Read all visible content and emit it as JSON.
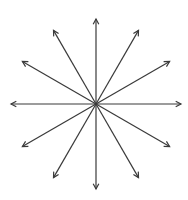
{
  "diagram": {
    "type": "radial-arrows",
    "center": [
      96,
      104
    ],
    "radius": 85,
    "arrow_count": 12,
    "angles_deg": [
      0,
      30,
      60,
      90,
      120,
      150,
      180,
      210,
      240,
      270,
      300,
      330
    ],
    "stroke_color": "#3a3a3a",
    "background": "#ffffff"
  }
}
